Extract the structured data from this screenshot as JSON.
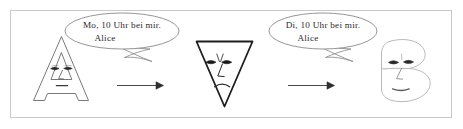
{
  "figure": {
    "kind": "man-in-the-middle-illustration",
    "border_color": "#c9c9c9",
    "background": "#ffffff",
    "ink_color": "#4a4a4a",
    "dark_ink_color": "#1f1f1f",
    "light_ink_color": "#a9a9a9"
  },
  "bubbles": [
    {
      "id": "bubble-left",
      "line1": "Mo, 10 Uhr bei mir.",
      "line2": "Alice"
    },
    {
      "id": "bubble-right",
      "line1": "Di, 10 Uhr bei mir.",
      "line2": "Alice"
    }
  ],
  "actors": [
    {
      "id": "sender",
      "glyph": "A",
      "label": "A"
    },
    {
      "id": "attacker",
      "glyph": "triangle-down",
      "label": "▽"
    },
    {
      "id": "receiver",
      "glyph": "B",
      "label": "B"
    }
  ],
  "arrows": [
    {
      "id": "arrow-left",
      "direction": "right"
    },
    {
      "id": "arrow-right",
      "direction": "right"
    }
  ]
}
